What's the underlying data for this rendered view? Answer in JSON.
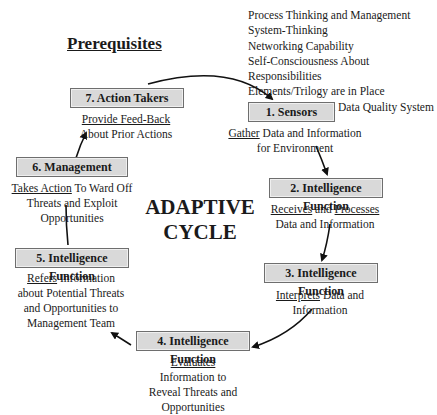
{
  "title": "Prerequisites",
  "prerequisites": [
    "Process Thinking and Management",
    "System-Thinking",
    "Networking Capability",
    "Self-Consciousness About Responsibilities",
    "Elements/Trilogy are in Place",
    "A latest-generation Data Quality System"
  ],
  "center_label": {
    "line1": "ADAPTIVE",
    "line2": "CYCLE"
  },
  "steps": [
    {
      "label": "1. Sensors",
      "verb": "Gather",
      "rest1": " Data and Information",
      "line2": "for Environment"
    },
    {
      "label": "2. Intelligence Function",
      "verb": "Receives",
      "mid": " and ",
      "verb2": "Processes",
      "line2": "Data and Information"
    },
    {
      "label": "3. Intelligence Function",
      "verb": "Interprets",
      "rest1": " Data and",
      "line2": "Information"
    },
    {
      "label": "4. Intelligence Function",
      "verb": "Evaluates",
      "line2": "Information to",
      "line3": "Reveal Threats and",
      "line4": "Opportunities"
    },
    {
      "label": "5. Intelligence Function",
      "verb": "Refers",
      "rest1": " Information",
      "line2": "about Potential Threats",
      "line3": "and Opportunities to",
      "line4": "Management Team"
    },
    {
      "label": "6. Management",
      "verb": "Takes Action",
      "rest1": " To Ward Off",
      "line2": "Threats and Exploit",
      "line3": "Opportunities"
    },
    {
      "label": "7. Action Takers",
      "verb": "Provide Feed-Back",
      "line2": "About Prior Actions"
    }
  ],
  "colors": {
    "box_fill": "#d9d9d9",
    "box_border": "#6e6e6e",
    "text": "#1a1a1a"
  }
}
